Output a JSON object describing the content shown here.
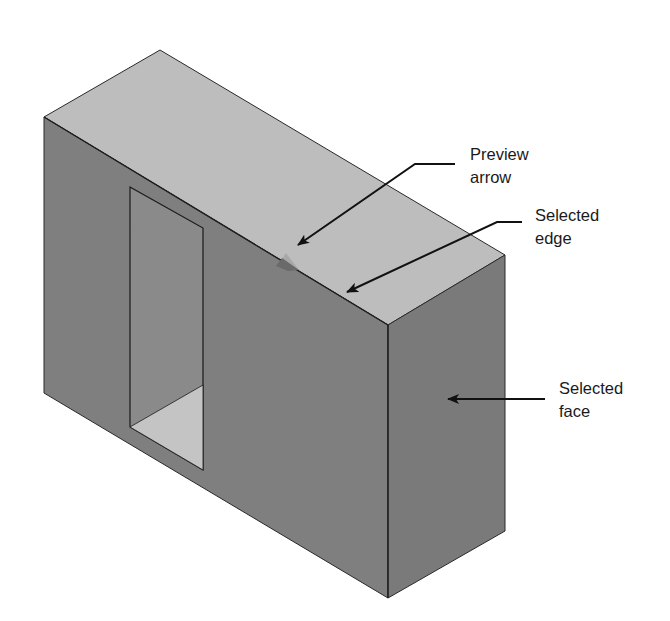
{
  "figure": {
    "colors": {
      "background": "#ffffff",
      "top_face": "#bdbdbd",
      "front_face": "#7f7f7f",
      "right_face": "#7a7a7a",
      "window_inner_wall": "#8a8a8a",
      "window_inner_floor": "#c4c4c4",
      "edge": "#2a2a2a",
      "leader": "#111111",
      "preview_arrow": "#9a9a9a"
    }
  },
  "callouts": [
    {
      "id": "preview-arrow",
      "label": "Preview\narrow",
      "x": 470,
      "y": 143
    },
    {
      "id": "selected-edge",
      "label": "Selected\nedge",
      "x": 535,
      "y": 204
    },
    {
      "id": "selected-face",
      "label": "Selected\nface",
      "x": 559,
      "y": 377
    }
  ]
}
